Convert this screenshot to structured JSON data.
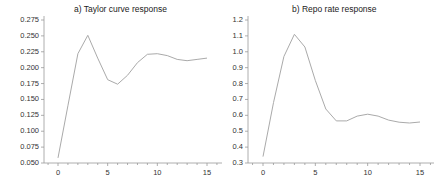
{
  "chart_data": [
    {
      "type": "line",
      "title": "a) Taylor curve response",
      "xlabel": "",
      "ylabel": "",
      "x": [
        0,
        1,
        2,
        3,
        4,
        5,
        6,
        7,
        8,
        9,
        10,
        11,
        12,
        13,
        14,
        15
      ],
      "series": [
        {
          "name": "Taylor curve response",
          "values": [
            0.058,
            0.14,
            0.222,
            0.251,
            0.215,
            0.181,
            0.174,
            0.188,
            0.208,
            0.221,
            0.222,
            0.219,
            0.213,
            0.211,
            0.213,
            0.215
          ]
        }
      ],
      "xlim": [
        -1.5,
        16.5
      ],
      "ylim": [
        0.05,
        0.275
      ],
      "xticks": [
        "0",
        "5",
        "10",
        "15"
      ],
      "yticks": [
        "0.275",
        "0.250",
        "0.225",
        "0.200",
        "0.175",
        "0.150",
        "0.125",
        "0.100",
        "0.075",
        "0.050"
      ],
      "grid": false,
      "legend": "none"
    },
    {
      "type": "line",
      "title": "b) Repo rate response",
      "xlabel": "",
      "ylabel": "",
      "x": [
        0,
        1,
        2,
        3,
        4,
        5,
        6,
        7,
        8,
        9,
        10,
        11,
        12,
        13,
        14,
        15
      ],
      "series": [
        {
          "name": "Repo rate response",
          "values": [
            0.34,
            0.68,
            0.97,
            1.11,
            1.03,
            0.82,
            0.64,
            0.565,
            0.565,
            0.595,
            0.607,
            0.595,
            0.57,
            0.557,
            0.552,
            0.558
          ]
        }
      ],
      "xlim": [
        -1.5,
        16.5
      ],
      "ylim": [
        0.3,
        1.2
      ],
      "xticks": [
        "0",
        "5",
        "10",
        "15"
      ],
      "yticks": [
        "1.2",
        "1.1",
        "1.0",
        "0.9",
        "0.8",
        "0.7",
        "0.6",
        "0.5",
        "0.4",
        "0.3"
      ],
      "grid": false,
      "legend": "none"
    }
  ],
  "panels": [
    {
      "title": "a) Taylor curve response"
    },
    {
      "title": "b) Repo rate response"
    }
  ],
  "colors": {
    "line": "#aaaaaa",
    "axis": "#999999",
    "text": "#222222"
  }
}
